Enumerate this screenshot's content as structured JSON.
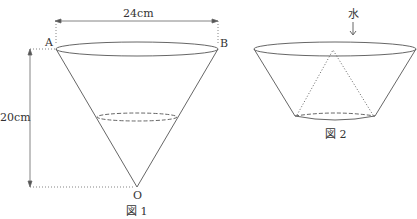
{
  "figure1": {
    "width_label": "24cm",
    "height_label": "20cm",
    "point_a": "A",
    "point_b": "B",
    "apex": "O",
    "caption": "図 1"
  },
  "figure2": {
    "water_label": "水",
    "water_arrow": "↓",
    "caption": "図 2"
  },
  "colors": {
    "stroke": "#555555",
    "text": "#333333"
  }
}
